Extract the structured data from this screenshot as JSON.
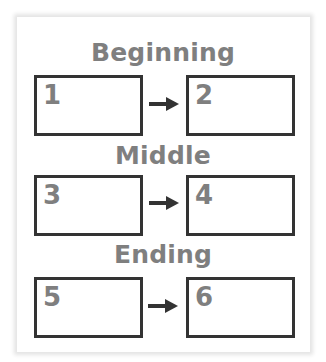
{
  "diagram": {
    "stages": [
      {
        "heading": "Beginning",
        "boxes": [
          {
            "label": "1"
          },
          {
            "label": "2"
          }
        ],
        "connector": "arrow-right"
      },
      {
        "heading": "Middle",
        "boxes": [
          {
            "label": "3"
          },
          {
            "label": "4"
          }
        ],
        "connector": "arrow-right"
      },
      {
        "heading": "Ending",
        "boxes": [
          {
            "label": "5"
          },
          {
            "label": "6"
          }
        ],
        "connector": "arrow-right"
      }
    ]
  },
  "colors": {
    "heading_text": "#7f7f7f",
    "box_border": "#333333",
    "number_text": "#7f7f7f",
    "arrow": "#333333",
    "panel_shadow": "#e4e4e4"
  }
}
